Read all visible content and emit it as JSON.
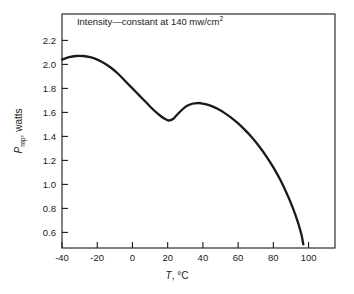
{
  "chart_data": {
    "type": "line",
    "title": "",
    "subtitle": "",
    "annotations": [
      {
        "name": "intensity-note",
        "text_prefix": "Intensity",
        "text_dash": "—",
        "text_main": "constant at 140 mw/cm",
        "text_sup": "2",
        "full_text": "Intensity—constant at 140 mw/cm2",
        "x_data": 10,
        "y_data": 2.33
      }
    ],
    "xlabel_parts": {
      "symbol": "T",
      "rest": ", °C"
    },
    "xlabel": "T, °C",
    "ylabel_parts": {
      "symbol": "P",
      "subscript": "mp",
      "rest": ", watts"
    },
    "ylabel": "Pmp, watts",
    "xlim": [
      -40,
      115
    ],
    "ylim": [
      0.47,
      2.42
    ],
    "xticks": [
      -40,
      -20,
      0,
      20,
      40,
      60,
      80,
      100
    ],
    "xticklabels": [
      "-40",
      "-20",
      "0",
      "20",
      "40",
      "60",
      "80",
      "100"
    ],
    "yticks": [
      0.6,
      0.8,
      1.0,
      1.2,
      1.4,
      1.6,
      1.8,
      2.0,
      2.2
    ],
    "yticklabels": [
      "0.6",
      "0.8",
      "1.0",
      "1.2",
      "1.4",
      "1.6",
      "1.8",
      "2.0",
      "2.2"
    ],
    "grid": false,
    "legend": null,
    "frame": "box",
    "tick_direction": "in",
    "line_color": "#1a1a1a",
    "line_width": 2.3,
    "series": [
      {
        "name": "Pmp vs T",
        "x": [
          -40,
          -36,
          -32,
          -28,
          -24,
          -20,
          -16,
          -12,
          -8,
          -4,
          0,
          4,
          8,
          12,
          16,
          18,
          20,
          21,
          23,
          25,
          28,
          31,
          34,
          37,
          39,
          42,
          45,
          48,
          52,
          56,
          60,
          64,
          68,
          72,
          76,
          80,
          84,
          88,
          91,
          94,
          96,
          97
        ],
        "y": [
          2.04,
          2.06,
          2.07,
          2.07,
          2.06,
          2.04,
          2.01,
          1.97,
          1.92,
          1.86,
          1.8,
          1.74,
          1.68,
          1.62,
          1.57,
          1.55,
          1.535,
          1.533,
          1.545,
          1.575,
          1.62,
          1.655,
          1.672,
          1.678,
          1.676,
          1.667,
          1.652,
          1.632,
          1.598,
          1.556,
          1.508,
          1.452,
          1.388,
          1.316,
          1.234,
          1.142,
          1.036,
          0.912,
          0.806,
          0.682,
          0.578,
          0.5
        ]
      }
    ],
    "key_points": {
      "left_endpoint": {
        "x": -40,
        "y": 2.04
      },
      "global_max": {
        "x": -30,
        "y": 2.07
      },
      "local_min": {
        "x": 21,
        "y": 1.53
      },
      "local_max": {
        "x": 38,
        "y": 1.68
      },
      "right_endpoint": {
        "x": 97,
        "y": 0.5
      }
    }
  }
}
